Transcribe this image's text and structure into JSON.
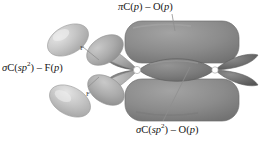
{
  "figure": {
    "background": "#ffffff"
  },
  "labels": {
    "pi_co": {
      "sym": "π",
      "a": "C(",
      "a_it": "p",
      "a_end": ")",
      "dash": " – ",
      "b": "O(",
      "b_it": "p",
      "b_end": ")",
      "full": "π C(p) – O(p)"
    },
    "sigma_cf": {
      "sym": "σ",
      "a": "C(",
      "a_it": "sp",
      "a_sup": "2",
      "a_end": ")",
      "dash": " – ",
      "b": "F(",
      "b_it": "p",
      "b_end": ")",
      "full": "σ C(sp2) – F(p)"
    },
    "sigma_co": {
      "sym": "σ",
      "a": "C(",
      "a_it": "sp",
      "a_sup": "2",
      "a_end": ")",
      "dash": " – ",
      "b": "O(",
      "b_it": "p",
      "b_end": ")",
      "full": "σ C(sp2) – O(p)"
    },
    "atom_f_top": "F",
    "atom_f_bottom": "F"
  },
  "colors": {
    "pi_cloud": "#8a8a8a",
    "pi_cloud_edge": "#6f6f6f",
    "sigma_lens": "#7c7c7c",
    "sp2_lobe_dark": "#6e6e6e",
    "f_lobe_light": "#c6c6c6",
    "f_lobe_mid": "#a9a9a9",
    "o_lone_pair": "#6a6a6a",
    "nucleus": "#ffffff",
    "leader_line": "#8e8e8e",
    "text": "#161616"
  },
  "geometry": {
    "carbon_node": {
      "x": 137,
      "y": 70
    },
    "oxygen_node": {
      "x": 215,
      "y": 70
    },
    "pi_top_cloud": {
      "x": 125,
      "y": 22,
      "w": 113,
      "h": 40
    },
    "pi_bottom_cloud": {
      "x": 125,
      "y": 80,
      "w": 113,
      "h": 40
    },
    "sigma_lens": {
      "cx": 176,
      "cy": 70,
      "rx": 40,
      "ry": 15
    }
  },
  "leaders": [
    {
      "name": "pi-leader",
      "x1": 172,
      "y1": 14,
      "x2": 175,
      "y2": 30
    },
    {
      "name": "sigma-o-leader",
      "x1": 190,
      "y1": 68,
      "x2": 163,
      "y2": 120
    },
    {
      "name": "sigma-f-leader-top",
      "x1": 82,
      "y1": 48,
      "x2": 96,
      "y2": 60
    },
    {
      "name": "sigma-f-leader-bottom",
      "x1": 88,
      "y1": 88,
      "x2": 98,
      "y2": 78
    }
  ]
}
